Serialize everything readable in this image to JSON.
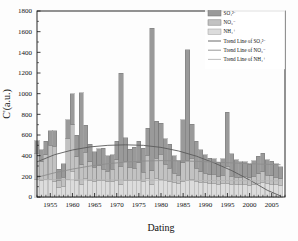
{
  "chart_data": {
    "type": "bar",
    "title": "",
    "xlabel": "Dating",
    "ylabel": "C'(a.u.)",
    "xlim": [
      1952,
      2008
    ],
    "ylim": [
      0,
      1800
    ],
    "ytick_step": 200,
    "xtick_step": 5,
    "xminor_step": 1,
    "grid": false,
    "stacked": true,
    "legend_position": "top-right",
    "yticks": [
      0,
      200,
      400,
      600,
      800,
      1000,
      1200,
      1400,
      1600,
      1800
    ],
    "xticks": [
      1955,
      1960,
      1965,
      1970,
      1975,
      1980,
      1985,
      1990,
      1995,
      2000,
      2005
    ],
    "x": [
      1952,
      1953,
      1954,
      1955,
      1956,
      1957,
      1958,
      1959,
      1960,
      1961,
      1962,
      1963,
      1964,
      1965,
      1966,
      1967,
      1968,
      1969,
      1970,
      1971,
      1972,
      1973,
      1974,
      1975,
      1976,
      1977,
      1978,
      1979,
      1980,
      1981,
      1982,
      1983,
      1984,
      1985,
      1986,
      1987,
      1988,
      1989,
      1990,
      1991,
      1992,
      1993,
      1994,
      1995,
      1996,
      1997,
      1998,
      1999,
      2000,
      2001,
      2002,
      2003,
      2004,
      2005,
      2006,
      2007
    ],
    "series": [
      {
        "name": "SO4",
        "label": "SO₄²⁻",
        "color": "#9a9a9a",
        "edge": "#6e6e6e",
        "values": [
          120,
          115,
          130,
          140,
          150,
          110,
          130,
          180,
          300,
          210,
          700,
          260,
          170,
          150,
          160,
          200,
          150,
          140,
          180,
          900,
          230,
          170,
          200,
          210,
          230,
          260,
          1380,
          360,
          300,
          250,
          230,
          170,
          140,
          420,
          1070,
          330,
          260,
          210,
          180,
          160,
          150,
          140,
          160,
          520,
          220,
          170,
          150,
          140,
          130,
          150,
          170,
          180,
          150,
          140,
          130,
          120
        ]
      },
      {
        "name": "NO3",
        "label": "NO₃⁻",
        "color": "#c2c2c2",
        "edge": "#7a7a7a",
        "values": [
          260,
          180,
          240,
          330,
          340,
          70,
          90,
          400,
          450,
          230,
          190,
          260,
          180,
          140,
          150,
          110,
          100,
          120,
          200,
          180,
          190,
          130,
          120,
          170,
          90,
          230,
          130,
          200,
          250,
          160,
          130,
          90,
          80,
          180,
          200,
          210,
          130,
          100,
          90,
          80,
          90,
          70,
          80,
          170,
          80,
          70,
          70,
          80,
          70,
          80,
          90,
          100,
          80,
          80,
          70,
          60
        ]
      },
      {
        "name": "NH4",
        "label": "NH₄⁺",
        "color": "#dcdcdc",
        "edge": "#9b9b9b",
        "values": [
          165,
          160,
          170,
          170,
          150,
          90,
          100,
          170,
          250,
          160,
          120,
          175,
          160,
          150,
          155,
          160,
          150,
          150,
          160,
          120,
          155,
          160,
          160,
          160,
          150,
          175,
          125,
          175,
          165,
          155,
          150,
          140,
          130,
          150,
          155,
          165,
          150,
          145,
          140,
          135,
          130,
          125,
          130,
          130,
          120,
          120,
          120,
          120,
          115,
          120,
          135,
          145,
          130,
          125,
          120,
          115
        ]
      }
    ],
    "trend_lines": [
      {
        "name": "trend-SO4",
        "label": "Trend Line of SO₄²⁻",
        "color": "#5a5a5a",
        "type": "quadratic",
        "points": [
          [
            1952,
            340
          ],
          [
            1956,
            410
          ],
          [
            1960,
            455
          ],
          [
            1964,
            485
          ],
          [
            1968,
            500
          ],
          [
            1972,
            505
          ],
          [
            1976,
            500
          ],
          [
            1980,
            480
          ],
          [
            1984,
            445
          ],
          [
            1988,
            395
          ],
          [
            1992,
            330
          ],
          [
            1996,
            255
          ],
          [
            2000,
            165
          ],
          [
            2004,
            65
          ],
          [
            2007,
            10
          ]
        ]
      },
      {
        "name": "trend-NO3",
        "label": "Trend Line of NO₃⁻",
        "color": "#8d8d8d",
        "type": "quadratic",
        "points": [
          [
            1952,
            190
          ],
          [
            1956,
            235
          ],
          [
            1960,
            270
          ],
          [
            1964,
            300
          ],
          [
            1968,
            322
          ],
          [
            1972,
            338
          ],
          [
            1976,
            348
          ],
          [
            1980,
            352
          ],
          [
            1984,
            350
          ],
          [
            1988,
            345
          ],
          [
            1992,
            338
          ],
          [
            1996,
            330
          ],
          [
            2000,
            322
          ],
          [
            2004,
            316
          ],
          [
            2007,
            312
          ]
        ]
      },
      {
        "name": "trend-NH4",
        "label": "Trend Line of NH₄⁺",
        "color": "#b5b5b5",
        "type": "linear",
        "points": [
          [
            1952,
            168
          ],
          [
            1980,
            162
          ],
          [
            2007,
            156
          ]
        ]
      }
    ]
  },
  "legend": {
    "entries": [
      {
        "kind": "swatch",
        "label": "SO₄²⁻",
        "name": "legend-swatch-so4"
      },
      {
        "kind": "swatch",
        "label": "NO₃⁻",
        "name": "legend-swatch-no3"
      },
      {
        "kind": "swatch",
        "label": "NH₄⁺",
        "name": "legend-swatch-nh4"
      },
      {
        "kind": "line",
        "label": "Trend Line of SO₄²⁻",
        "name": "legend-line-so4"
      },
      {
        "kind": "line",
        "label": "Trend Line of NO₃⁻",
        "name": "legend-line-no3"
      },
      {
        "kind": "line",
        "label": "Trend Line of NH₄⁺",
        "name": "legend-line-nh4"
      }
    ]
  }
}
